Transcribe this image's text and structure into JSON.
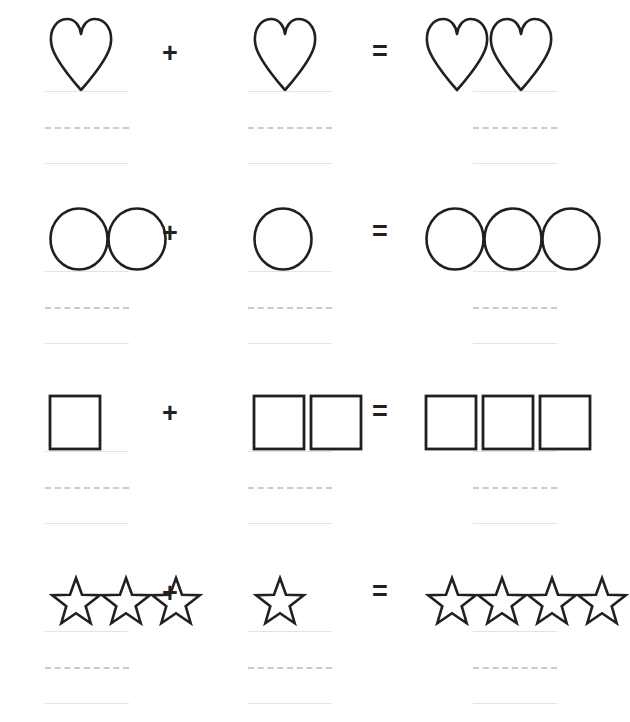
{
  "worksheet": {
    "title": "Shape addition counting worksheet",
    "page_width": 625,
    "page_height": 722,
    "background_color": "#ffffff",
    "shape_stroke_color": "#231f20",
    "line_solid_color": "#e3e3e6",
    "line_dashed_color": "#c9c9cf",
    "operator_color": "#231f20",
    "answer_lines": {
      "style": "handwriting-practice",
      "line_count": 3,
      "line_styles": [
        "solid",
        "dashed",
        "solid"
      ],
      "value": ""
    },
    "rows": [
      {
        "index": 1,
        "shape": "heart",
        "addend_1": 1,
        "operator_1": "+",
        "addend_2": 1,
        "operator_2": "=",
        "sum": 2,
        "equation": "1 + 1 = 2",
        "answer_1": "",
        "answer_2": "",
        "answer_sum": ""
      },
      {
        "index": 2,
        "shape": "circle",
        "addend_1": 2,
        "operator_1": "+",
        "addend_2": 1,
        "operator_2": "=",
        "sum": 3,
        "equation": "2 + 1 = 3",
        "answer_1": "",
        "answer_2": "",
        "answer_sum": ""
      },
      {
        "index": 3,
        "shape": "square",
        "addend_1": 1,
        "operator_1": "+",
        "addend_2": 2,
        "operator_2": "=",
        "sum": 3,
        "equation": "1 + 2 = 3",
        "answer_1": "",
        "answer_2": "",
        "answer_sum": ""
      },
      {
        "index": 4,
        "shape": "star",
        "addend_1": 3,
        "operator_1": "+",
        "addend_2": 1,
        "operator_2": "=",
        "sum": 4,
        "equation": "3 + 1 = 4",
        "answer_1": "",
        "answer_2": "",
        "answer_sum": ""
      }
    ]
  }
}
